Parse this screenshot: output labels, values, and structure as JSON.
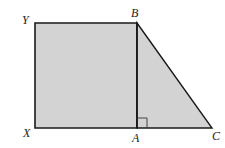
{
  "diagram": {
    "colors": {
      "fill": "#d3d3d3",
      "stroke": "#1a1a1a",
      "label": "#222222"
    },
    "points": {
      "Y": {
        "label": "Y",
        "x": 35,
        "y": 23
      },
      "B": {
        "label": "B",
        "x": 137,
        "y": 23
      },
      "X": {
        "label": "X",
        "x": 35,
        "y": 128
      },
      "A": {
        "label": "A",
        "x": 137,
        "y": 128
      },
      "C": {
        "label": "C",
        "x": 212,
        "y": 128
      }
    },
    "labels": {
      "Y": "Y",
      "B": "B",
      "X": "X",
      "A": "A",
      "C": "C"
    },
    "shapes": [
      {
        "name": "square",
        "vertices": [
          "X",
          "Y",
          "B",
          "A"
        ]
      },
      {
        "name": "right-triangle",
        "vertices": [
          "A",
          "B",
          "C"
        ],
        "right_angle_at": "A"
      }
    ]
  }
}
